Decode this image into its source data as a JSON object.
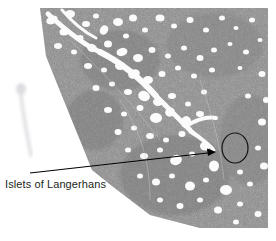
{
  "figure": {
    "kind": "histology-micrograph",
    "title_visible": false,
    "annotation": {
      "label": "Islets of Langerhans",
      "label_color": "#231f20",
      "leader_line_color": "#000000",
      "leader_line_start": [
        30,
        173
      ],
      "leader_line_end": [
        216,
        152
      ],
      "arrowhead_at": "end",
      "marker_shape": "ellipse",
      "marker_center": [
        235,
        148
      ],
      "marker_radius_x": 13,
      "marker_radius_y": 15,
      "marker_color": "#111111"
    },
    "specimen": {
      "description": "pancreas tissue section",
      "tissue_gray": "#8a8a8a",
      "tissue_dark": "#6f6f6f",
      "background": "#ffffff",
      "globule_color": "#fdfdfd",
      "edge_description": "diagonal cut edge running from upper-left down to lower-left corner",
      "artifact": "faint vertical smudge at left margin"
    }
  }
}
